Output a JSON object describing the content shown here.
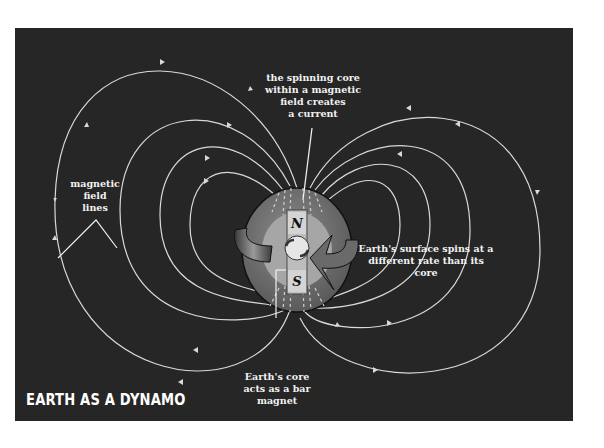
{
  "title": "EARTH AS A DYNAMO",
  "labels": {
    "spinning_core": "the spinning core\nwithin a magnetic\nfield creates\na current",
    "field_lines": "magnetic\nfield\nlines",
    "surface_spins": "Earth's surface spins at a\ndifferent rate than its core",
    "core_magnet": "Earth's core\nacts as a bar\nmagnet"
  },
  "poles": {
    "north": "N",
    "south": "S"
  },
  "colors": {
    "background": "#262626",
    "field_line": "#d9d9d9",
    "globe_outer": "#7a7a7a",
    "globe_mantle": "#a6a6a6",
    "core": "#e6e6e6",
    "text": "#f2f2f2"
  }
}
